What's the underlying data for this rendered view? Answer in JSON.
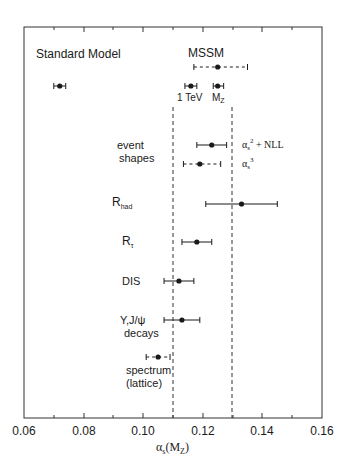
{
  "chart_data": {
    "type": "scatter",
    "subtype": "horizontal-error-bar",
    "title": "",
    "xlabel": "αs(MZ)",
    "ylabel": "",
    "xlim": [
      0.06,
      0.16
    ],
    "xticks": [
      0.06,
      0.08,
      0.1,
      0.12,
      0.14,
      0.16
    ],
    "xtick_labels": [
      "0.06",
      "0.08",
      "0.10",
      "0.12",
      "0.14",
      "0.16"
    ],
    "minor_xticks": [
      0.07,
      0.09,
      0.11,
      0.13,
      0.15
    ],
    "grid": false,
    "reference_lines": [
      {
        "x": 0.11,
        "style": "dashed"
      },
      {
        "x": 0.13,
        "style": "dashed"
      }
    ],
    "annotations": [
      "Standard Model",
      "MSSM",
      "1 TeV",
      "MZ"
    ],
    "points": [
      {
        "group": "Standard Model",
        "label": "",
        "value": 0.072,
        "low": 0.07,
        "high": 0.074,
        "style": "solid"
      },
      {
        "group": "MSSM",
        "label": "MSSM",
        "value": 0.125,
        "low": 0.117,
        "high": 0.135,
        "style": "dashed"
      },
      {
        "group": "MSSM",
        "label": "1 TeV",
        "value": 0.116,
        "low": 0.114,
        "high": 0.118,
        "style": "solid"
      },
      {
        "group": "MSSM",
        "label": "MZ",
        "value": 0.125,
        "low": 0.1235,
        "high": 0.127,
        "style": "solid"
      },
      {
        "group": "event shapes",
        "label": "αs² + NLL",
        "value": 0.123,
        "low": 0.118,
        "high": 0.128,
        "style": "solid"
      },
      {
        "group": "event shapes",
        "label": "αs³",
        "value": 0.119,
        "low": 0.1135,
        "high": 0.126,
        "style": "dashed"
      },
      {
        "group": "Rhad",
        "label": "Rhad",
        "value": 0.133,
        "low": 0.121,
        "high": 0.145,
        "style": "solid"
      },
      {
        "group": "Rτ",
        "label": "Rτ",
        "value": 0.118,
        "low": 0.113,
        "high": 0.123,
        "style": "solid"
      },
      {
        "group": "DIS",
        "label": "DIS",
        "value": 0.112,
        "low": 0.107,
        "high": 0.117,
        "style": "solid"
      },
      {
        "group": "Υ,J/ψ decays",
        "label": "Υ,J/ψ decays",
        "value": 0.113,
        "low": 0.107,
        "high": 0.119,
        "style": "solid"
      },
      {
        "group": "spectrum (lattice)",
        "label": "spectrum (lattice)",
        "value": 0.105,
        "low": 0.101,
        "high": 0.109,
        "style": "dashed"
      }
    ]
  },
  "labels": {
    "standard_model": "Standard Model",
    "mssm": "MSSM",
    "tev": "1 TeV",
    "mz_main": "M",
    "mz_sub": "Z",
    "event": "event",
    "shapes": "shapes",
    "nll_alpha": "α",
    "nll_sub": "s",
    "nll_sup": "2",
    "nll_rest": " + NLL",
    "a3_alpha": "α",
    "a3_sub": "s",
    "a3_sup": "3",
    "rhad_main": "R",
    "rhad_sub": "had",
    "rtau_main": "R",
    "rtau_sub": "τ",
    "dis": "DIS",
    "upsilon": "Υ,J/ψ",
    "decays": "decays",
    "spectrum": "spectrum",
    "lattice": "(lattice)",
    "xaxis_alpha": "α",
    "xaxis_sub": "s",
    "xaxis_open": "(M",
    "xaxis_msub": "Z",
    "xaxis_close": ")"
  },
  "ticks": [
    "0.06",
    "0.08",
    "0.10",
    "0.12",
    "0.14",
    "0.16"
  ],
  "colors": {
    "ink": "#1a1a1a",
    "frame": "#333333",
    "background": "#ffffff"
  }
}
